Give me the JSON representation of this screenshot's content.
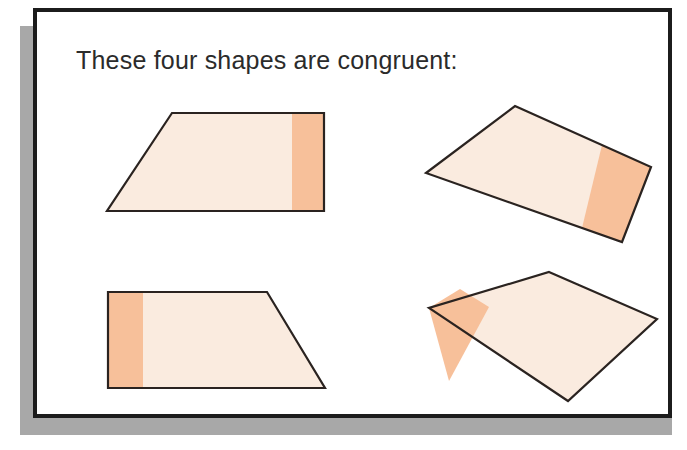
{
  "page": {
    "title_text": "These four shapes are congruent:",
    "background_color": "#ffffff",
    "frame_border_color": "#1c1c1c",
    "shadow_color": "#a8a8a8",
    "text_color": "#2b2b2b"
  },
  "palette": {
    "shape_fill_pale": "#faebdf",
    "shape_fill_orange": "#f7c09a",
    "shape_outline": "#2a2320"
  },
  "shapes": [
    {
      "id": "shape-1",
      "name": "trapezoid-upright-band-right",
      "description": "Upright trapezoid, orange band along right edge",
      "outline_points": "135,101 287,101 287,199 70,199",
      "band_points": "255,101 287,101 287,199 255,199",
      "fill": "#faebdf",
      "band_fill": "#f7c09a",
      "stroke": "#2a2320",
      "stroke_width": 2.2
    },
    {
      "id": "shape-2",
      "name": "trapezoid-rotated-band-right",
      "description": "Rotated trapezoid (approx 25 degrees), orange band near right edge",
      "outline_points": "478,94 614,155 585,230 389,161",
      "band_points": "565,133 614,155 585,230 545,216",
      "fill": "#faebdf",
      "band_fill": "#f7c09a",
      "stroke": "#2a2320",
      "stroke_width": 2.2
    },
    {
      "id": "shape-3",
      "name": "trapezoid-mirrored-band-left",
      "description": "Mirrored trapezoid, orange band along left edge",
      "outline_points": "71,280 230,280 288,376 71,376",
      "band_points": "71,280 106,280 106,376 71,376",
      "fill": "#faebdf",
      "band_fill": "#f7c09a",
      "stroke": "#2a2320",
      "stroke_width": 2.2
    },
    {
      "id": "shape-4",
      "name": "trapezoid-rotated-band-left",
      "description": "Rotated trapezoid, orange band along left edge",
      "outline_points": "512,260 620,307 531,389 392,296",
      "band_points": "423,277 452,295 412,369 392,296",
      "fill": "#faebdf",
      "band_fill": "#f7c09a",
      "stroke": "#2a2320",
      "stroke_width": 2.2
    }
  ],
  "shape_count": 4
}
